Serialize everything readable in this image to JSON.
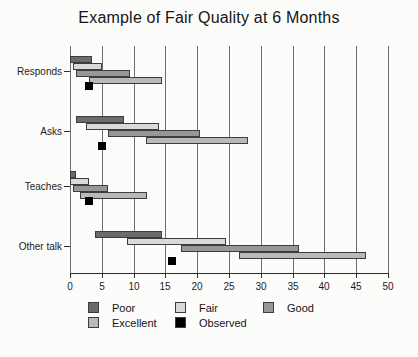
{
  "title": "Example of Fair Quality at 6 Months",
  "chart_data": {
    "type": "bar",
    "orientation": "horizontal",
    "title": "Example of Fair Quality at 6 Months",
    "categories": [
      "Responds",
      "Asks",
      "Teaches",
      "Other talk"
    ],
    "x_axis": {
      "min": 0,
      "max": 50,
      "tick_step": 5,
      "ticks": [
        0,
        5,
        10,
        15,
        20,
        25,
        30,
        35,
        40,
        45,
        50
      ]
    },
    "grid": "vertical-lines-every-5",
    "legend_position": "bottom",
    "series": [
      {
        "name": "Poor",
        "color": "#6b6b6b",
        "ranges": [
          [
            0,
            3.5
          ],
          [
            1,
            8.5
          ],
          [
            0,
            1
          ],
          [
            4,
            14.5
          ]
        ]
      },
      {
        "name": "Fair",
        "color": "#d9d9d9",
        "ranges": [
          [
            0.5,
            5
          ],
          [
            2.5,
            14
          ],
          [
            0,
            3
          ],
          [
            9,
            24.5
          ]
        ]
      },
      {
        "name": "Good",
        "color": "#979797",
        "ranges": [
          [
            1,
            9.5
          ],
          [
            6,
            20.5
          ],
          [
            0.5,
            6
          ],
          [
            17.5,
            36
          ]
        ]
      },
      {
        "name": "Excellent",
        "color": "#b9b9b9",
        "ranges": [
          [
            3,
            14.5
          ],
          [
            12,
            28
          ],
          [
            1.5,
            12
          ],
          [
            26.5,
            46.5
          ]
        ]
      }
    ],
    "observed": {
      "name": "Observed",
      "color": "#000000",
      "values": [
        3,
        5,
        3,
        16
      ]
    }
  },
  "legend": {
    "items": [
      {
        "label": "Poor",
        "color": "#6b6b6b"
      },
      {
        "label": "Fair",
        "color": "#d9d9d9"
      },
      {
        "label": "Good",
        "color": "#979797"
      },
      {
        "label": "Excellent",
        "color": "#b9b9b9"
      },
      {
        "label": "Observed",
        "color": "#000000"
      }
    ]
  }
}
